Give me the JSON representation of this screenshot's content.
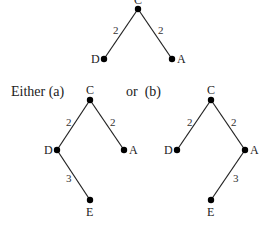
{
  "captions": {
    "either": "Either (a)",
    "or": "or  (b)"
  },
  "trees": {
    "top": {
      "nodes": {
        "C": {
          "label": "C"
        },
        "D": {
          "label": "D"
        },
        "A": {
          "label": "A"
        }
      },
      "edges": [
        {
          "from": "C",
          "to": "D",
          "weight": "2"
        },
        {
          "from": "C",
          "to": "A",
          "weight": "2"
        }
      ]
    },
    "a": {
      "nodes": {
        "C": {
          "label": "C"
        },
        "D": {
          "label": "D"
        },
        "A": {
          "label": "A"
        },
        "E": {
          "label": "E"
        }
      },
      "edges": [
        {
          "from": "C",
          "to": "D",
          "weight": "2"
        },
        {
          "from": "C",
          "to": "A",
          "weight": "2"
        },
        {
          "from": "D",
          "to": "E",
          "weight": "3"
        }
      ]
    },
    "b": {
      "nodes": {
        "C": {
          "label": "C"
        },
        "D": {
          "label": "D"
        },
        "A": {
          "label": "A"
        },
        "E": {
          "label": "E"
        }
      },
      "edges": [
        {
          "from": "C",
          "to": "D",
          "weight": "2"
        },
        {
          "from": "C",
          "to": "A",
          "weight": "2"
        },
        {
          "from": "A",
          "to": "E",
          "weight": "3"
        }
      ]
    }
  }
}
